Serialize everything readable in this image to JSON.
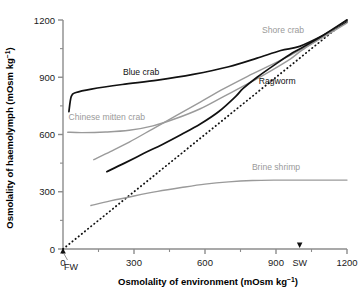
{
  "chart_data": {
    "type": "line",
    "title": "",
    "xlabel": "Osmolality of environment (mOsm kg⁻¹)",
    "ylabel": "Osmolality of haemolymph (mOsm kg⁻¹)",
    "xlabel_main": "Osmolality of environment (mOsm kg",
    "xlabel_sup": "−1",
    "xlabel_tail": ")",
    "ylabel_main": "Osmolality of haemolymph (mOsm kg",
    "ylabel_sup": "−1",
    "ylabel_tail": ")",
    "xlim": [
      0,
      1200
    ],
    "ylim": [
      0,
      1200
    ],
    "xticks": [
      0,
      300,
      600,
      900,
      1200
    ],
    "yticks": [
      0,
      300,
      600,
      900,
      1200
    ],
    "xtick_labels": [
      "0",
      "300",
      "600",
      "900",
      "1200"
    ],
    "ytick_labels": [
      "0",
      "300",
      "600",
      "900",
      "1200"
    ],
    "xminor_ticks": [
      150,
      450,
      750,
      1050
    ],
    "yminor_ticks": [
      150,
      450,
      750,
      1050
    ],
    "grid": false,
    "legend_position": "inline-annotations",
    "annotations": [
      {
        "name": "fw-marker",
        "label": "FW",
        "x": 0,
        "y": 0
      },
      {
        "name": "sw-marker",
        "label": "SW",
        "x": 1000,
        "y": 0
      }
    ],
    "series": [
      {
        "name": "Isosmotic line",
        "label": "",
        "style": "dotted",
        "color": "#111111",
        "points": [
          [
            0,
            0
          ],
          [
            1200,
            1200
          ]
        ]
      },
      {
        "name": "Blue crab",
        "label": "Blue crab",
        "style": "solid",
        "color": "#111111",
        "label_x": 330,
        "label_y": 930,
        "points": [
          [
            25,
            720
          ],
          [
            35,
            800
          ],
          [
            55,
            820
          ],
          [
            120,
            838
          ],
          [
            250,
            862
          ],
          [
            400,
            885
          ],
          [
            550,
            915
          ],
          [
            700,
            955
          ],
          [
            820,
            1000
          ],
          [
            920,
            1040
          ],
          [
            1000,
            1062
          ],
          [
            1100,
            1120
          ],
          [
            1200,
            1190
          ]
        ]
      },
      {
        "name": "Chinese mitten crab",
        "label": "Chinese mitten crab",
        "style": "solid",
        "color": "#9a9a9a",
        "label_x": 185,
        "label_y": 690,
        "points": [
          [
            20,
            612
          ],
          [
            80,
            610
          ],
          [
            180,
            613
          ],
          [
            280,
            622
          ],
          [
            380,
            645
          ],
          [
            480,
            685
          ],
          [
            580,
            735
          ],
          [
            680,
            800
          ],
          [
            780,
            865
          ],
          [
            880,
            935
          ],
          [
            960,
            995
          ],
          [
            1010,
            1042
          ],
          [
            1100,
            1115
          ],
          [
            1200,
            1200
          ]
        ]
      },
      {
        "name": "Shore crab",
        "label": "Shore crab",
        "style": "solid",
        "color": "#9a9a9a",
        "label_x": 930,
        "label_y": 1150,
        "points": [
          [
            130,
            468
          ],
          [
            200,
            510
          ],
          [
            280,
            560
          ],
          [
            380,
            630
          ],
          [
            480,
            700
          ],
          [
            580,
            770
          ],
          [
            680,
            840
          ],
          [
            780,
            905
          ],
          [
            880,
            965
          ],
          [
            960,
            1015
          ],
          [
            1010,
            1048
          ],
          [
            1100,
            1110
          ],
          [
            1200,
            1185
          ]
        ]
      },
      {
        "name": "Ragworm",
        "label": "Ragworm",
        "style": "solid",
        "color": "#111111",
        "label_x": 905,
        "label_y": 880,
        "points": [
          [
            185,
            405
          ],
          [
            260,
            450
          ],
          [
            340,
            500
          ],
          [
            420,
            548
          ],
          [
            500,
            600
          ],
          [
            580,
            655
          ],
          [
            660,
            722
          ],
          [
            730,
            800
          ],
          [
            760,
            840
          ],
          [
            820,
            900
          ],
          [
            900,
            970
          ],
          [
            970,
            1028
          ],
          [
            1010,
            1055
          ],
          [
            1100,
            1120
          ],
          [
            1200,
            1200
          ]
        ]
      },
      {
        "name": "Brine shrimp",
        "label": "Brine shrimp",
        "style": "solid",
        "color": "#9a9a9a",
        "label_x": 900,
        "label_y": 432,
        "points": [
          [
            118,
            228
          ],
          [
            200,
            252
          ],
          [
            300,
            278
          ],
          [
            400,
            302
          ],
          [
            500,
            322
          ],
          [
            600,
            340
          ],
          [
            700,
            352
          ],
          [
            800,
            359
          ],
          [
            900,
            361
          ],
          [
            1000,
            361
          ],
          [
            1100,
            361
          ],
          [
            1200,
            361
          ]
        ]
      }
    ]
  }
}
